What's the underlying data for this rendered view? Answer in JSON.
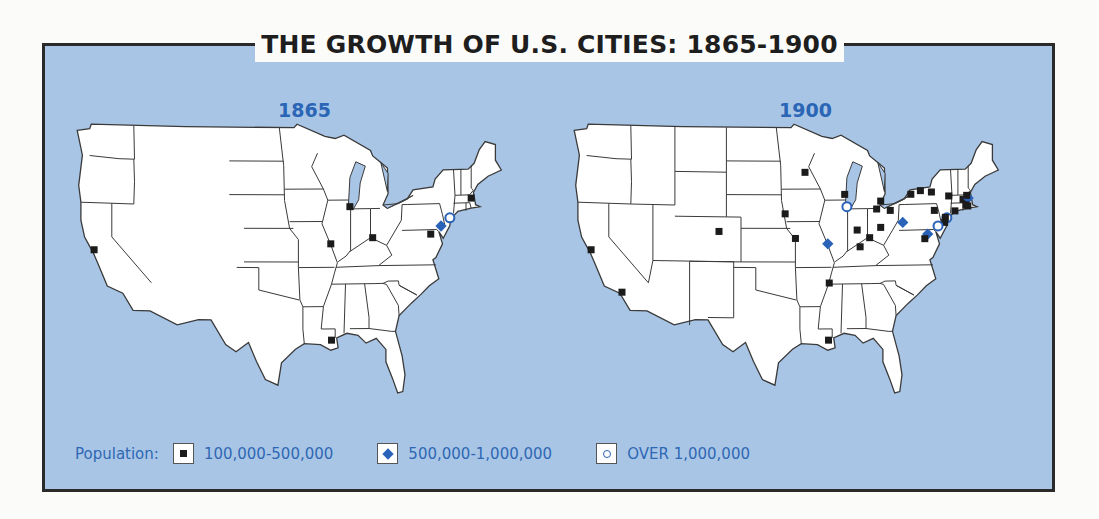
{
  "title": "THE GROWTH OF U.S. CITIES: 1865-1900",
  "colors": {
    "water": "#a9c5e6",
    "land": "#ffffff",
    "border": "#3a3a3a",
    "accent_blue": "#2a62b8",
    "small_city": "#1b1b1b"
  },
  "legend": {
    "label": "Population:",
    "items": [
      {
        "symbol": "square-icon",
        "label": "100,000-500,000"
      },
      {
        "symbol": "diamond-icon",
        "label": "500,000-1,000,000"
      },
      {
        "symbol": "circle-icon",
        "label": "OVER 1,000,000"
      }
    ]
  },
  "maps": [
    {
      "year": "1865",
      "cities": [
        {
          "name": "San Francisco",
          "lon": -122.4,
          "lat": 37.8,
          "size": "small"
        },
        {
          "name": "New Orleans",
          "lon": -90.1,
          "lat": 30.0,
          "size": "small"
        },
        {
          "name": "St. Louis",
          "lon": -90.2,
          "lat": 38.6,
          "size": "small"
        },
        {
          "name": "Chicago",
          "lon": -87.6,
          "lat": 41.9,
          "size": "small"
        },
        {
          "name": "Cincinnati",
          "lon": -84.5,
          "lat": 39.1,
          "size": "small"
        },
        {
          "name": "Baltimore",
          "lon": -76.6,
          "lat": 39.3,
          "size": "small"
        },
        {
          "name": "Boston",
          "lon": -71.1,
          "lat": 42.4,
          "size": "small"
        },
        {
          "name": "Philadelphia",
          "lon": -75.2,
          "lat": 40.0,
          "size": "medium"
        },
        {
          "name": "New York",
          "lon": -74.0,
          "lat": 40.7,
          "size": "large"
        }
      ]
    },
    {
      "year": "1900",
      "cities": [
        {
          "name": "San Francisco",
          "lon": -122.4,
          "lat": 37.8,
          "size": "small"
        },
        {
          "name": "Los Angeles",
          "lon": -118.2,
          "lat": 34.1,
          "size": "small"
        },
        {
          "name": "Denver",
          "lon": -105.0,
          "lat": 39.7,
          "size": "small"
        },
        {
          "name": "Omaha",
          "lon": -96.0,
          "lat": 41.3,
          "size": "small"
        },
        {
          "name": "Kansas City",
          "lon": -94.6,
          "lat": 39.1,
          "size": "small"
        },
        {
          "name": "Minneapolis",
          "lon": -93.3,
          "lat": 45.0,
          "size": "small"
        },
        {
          "name": "Milwaukee",
          "lon": -87.9,
          "lat": 43.0,
          "size": "small"
        },
        {
          "name": "Chicago",
          "lon": -87.6,
          "lat": 41.9,
          "size": "large"
        },
        {
          "name": "St. Louis",
          "lon": -90.2,
          "lat": 38.6,
          "size": "medium"
        },
        {
          "name": "Memphis",
          "lon": -90.0,
          "lat": 35.1,
          "size": "small"
        },
        {
          "name": "New Orleans",
          "lon": -90.1,
          "lat": 30.0,
          "size": "small"
        },
        {
          "name": "Indianapolis",
          "lon": -86.2,
          "lat": 39.8,
          "size": "small"
        },
        {
          "name": "Louisville",
          "lon": -85.8,
          "lat": 38.3,
          "size": "small"
        },
        {
          "name": "Cincinnati",
          "lon": -84.5,
          "lat": 39.1,
          "size": "small"
        },
        {
          "name": "Columbus",
          "lon": -83.0,
          "lat": 40.0,
          "size": "small"
        },
        {
          "name": "Detroit",
          "lon": -83.0,
          "lat": 42.35,
          "size": "small"
        },
        {
          "name": "Toledo",
          "lon": -83.55,
          "lat": 41.65,
          "size": "small"
        },
        {
          "name": "Cleveland",
          "lon": -81.7,
          "lat": 41.5,
          "size": "small"
        },
        {
          "name": "Pittsburgh",
          "lon": -80.0,
          "lat": 40.4,
          "size": "medium"
        },
        {
          "name": "Buffalo",
          "lon": -78.9,
          "lat": 42.9,
          "size": "small"
        },
        {
          "name": "Rochester",
          "lon": -77.6,
          "lat": 43.2,
          "size": "small"
        },
        {
          "name": "Syracuse",
          "lon": -76.1,
          "lat": 43.05,
          "size": "small"
        },
        {
          "name": "Scranton",
          "lon": -75.7,
          "lat": 41.4,
          "size": "small"
        },
        {
          "name": "Albany",
          "lon": -73.75,
          "lat": 42.65,
          "size": "small"
        },
        {
          "name": "Worcester",
          "lon": -71.8,
          "lat": 42.3,
          "size": "small"
        },
        {
          "name": "Boston",
          "lon": -71.1,
          "lat": 42.4,
          "size": "medium"
        },
        {
          "name": "Providence",
          "lon": -71.4,
          "lat": 41.8,
          "size": "small"
        },
        {
          "name": "New Haven",
          "lon": -72.9,
          "lat": 41.3,
          "size": "small"
        },
        {
          "name": "Fall River",
          "lon": -71.15,
          "lat": 41.7,
          "size": "small"
        },
        {
          "name": "Lowell",
          "lon": -71.3,
          "lat": 42.65,
          "size": "small"
        },
        {
          "name": "New York",
          "lon": -74.0,
          "lat": 40.7,
          "size": "large"
        },
        {
          "name": "Newark",
          "lon": -74.2,
          "lat": 40.75,
          "size": "small"
        },
        {
          "name": "Jersey City",
          "lon": -74.3,
          "lat": 40.3,
          "size": "small"
        },
        {
          "name": "Philadelphia",
          "lon": -75.2,
          "lat": 40.0,
          "size": "large"
        },
        {
          "name": "Baltimore",
          "lon": -76.6,
          "lat": 39.3,
          "size": "medium"
        },
        {
          "name": "Washington",
          "lon": -77.0,
          "lat": 38.9,
          "size": "small"
        }
      ]
    }
  ]
}
